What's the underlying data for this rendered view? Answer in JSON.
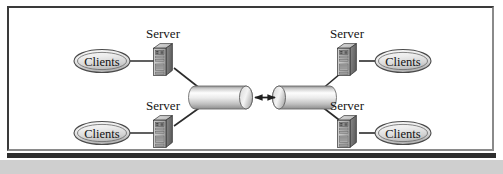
{
  "figure": {
    "kind": "network-topology-diagram",
    "title": "",
    "background_color": "#ffffff",
    "frame_border_color": "#3a3a3a",
    "shadow_bar_color": "#2e2e2e",
    "shadow_band_color": "#cfcfcf"
  },
  "labels": {
    "server": "Server",
    "clients": "Clients"
  },
  "nodes": {
    "servers": [
      {
        "id": "server-top-left",
        "label": "Server",
        "x": 153,
        "y": 52,
        "label_x": 155,
        "label_y": 22
      },
      {
        "id": "server-bottom-left",
        "label": "Server",
        "x": 153,
        "y": 124,
        "label_x": 155,
        "label_y": 94
      },
      {
        "id": "server-top-right",
        "label": "Server",
        "x": 337,
        "y": 52,
        "label_x": 339,
        "label_y": 22
      },
      {
        "id": "server-bottom-right",
        "label": "Server",
        "x": 337,
        "y": 124,
        "label_x": 339,
        "label_y": 94
      }
    ],
    "clients": [
      {
        "id": "clients-top-left",
        "label": "Clients",
        "cx": 95,
        "cy": 55
      },
      {
        "id": "clients-bottom-left",
        "label": "Clients",
        "cx": 95,
        "cy": 127
      },
      {
        "id": "clients-top-right",
        "label": "Clients",
        "cx": 396,
        "cy": 55
      },
      {
        "id": "clients-bottom-right",
        "label": "Clients",
        "cx": 396,
        "cy": 127
      }
    ],
    "cylinders": [
      {
        "id": "cylinder-left",
        "label": "",
        "x": 181,
        "y": 80,
        "width": 63,
        "height": 23
      },
      {
        "id": "cylinder-right",
        "label": "",
        "x": 265,
        "y": 80,
        "width": 63,
        "height": 23
      }
    ]
  },
  "connectors": {
    "client_links": [
      {
        "id": "link-clients-server-top-left",
        "from": "clients-top-left",
        "to": "server-top-left"
      },
      {
        "id": "link-clients-server-bottom-left",
        "from": "clients-bottom-left",
        "to": "server-bottom-left"
      },
      {
        "id": "link-clients-server-top-right",
        "from": "clients-top-right",
        "to": "server-top-right"
      },
      {
        "id": "link-clients-server-bottom-right",
        "from": "clients-bottom-right",
        "to": "server-bottom-right"
      }
    ],
    "trunk_links": [
      {
        "id": "link-server-cylinder-top-left",
        "from": "server-top-left",
        "to": "cylinder-left"
      },
      {
        "id": "link-server-cylinder-bottom-left",
        "from": "server-bottom-left",
        "to": "cylinder-left"
      },
      {
        "id": "link-server-cylinder-top-right",
        "from": "server-top-right",
        "to": "cylinder-right"
      },
      {
        "id": "link-server-cylinder-bottom-right",
        "from": "server-bottom-right",
        "to": "cylinder-right"
      }
    ],
    "interconnect": {
      "id": "cylinder-interconnect-arrow",
      "type": "double-headed-arrow",
      "from": "cylinder-left",
      "to": "cylinder-right"
    }
  },
  "colors": {
    "line": "#2b2b2b",
    "ellipse_fill_light": "#f2f2f2",
    "ellipse_fill_dark": "#c3c3c3",
    "ellipse_stroke": "#4a4a4a",
    "cylinder_fill_light": "#fbfbfb",
    "cylinder_fill_dark": "#9a9a9a",
    "server_front": "#b9b9b9",
    "server_side": "#6f6f6f",
    "server_top": "#d8d8d8",
    "server_stroke": "#2f2f2f",
    "text": "#151515"
  }
}
